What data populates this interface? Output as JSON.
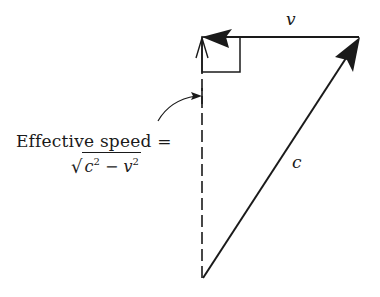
{
  "diagram": {
    "vectors": [
      {
        "name": "v",
        "label": "v",
        "from": [
          360,
          37
        ],
        "to": [
          202,
          37
        ],
        "style": "solid",
        "arrow": "filled"
      },
      {
        "name": "c",
        "label": "c",
        "from": [
          203,
          278
        ],
        "to": [
          360,
          37
        ],
        "style": "solid",
        "arrow": "filled"
      },
      {
        "name": "effective",
        "label": "Effective speed",
        "from": [
          202,
          278
        ],
        "to": [
          202,
          37
        ],
        "style": "dashed",
        "arrow": "open"
      }
    ],
    "right_angle_marker": {
      "x": 202,
      "y": 37,
      "width": 38,
      "height": 35
    },
    "labels": {
      "v": "v",
      "c": "c",
      "effective_speed": "Effective speed =",
      "formula_c": "c",
      "formula_exp1": "2",
      "formula_minus": "−",
      "formula_v": "v",
      "formula_exp2": "2",
      "formula_sqrt": "√"
    },
    "colors": {
      "stroke": "#1a1a1a",
      "background": "#ffffff"
    }
  }
}
